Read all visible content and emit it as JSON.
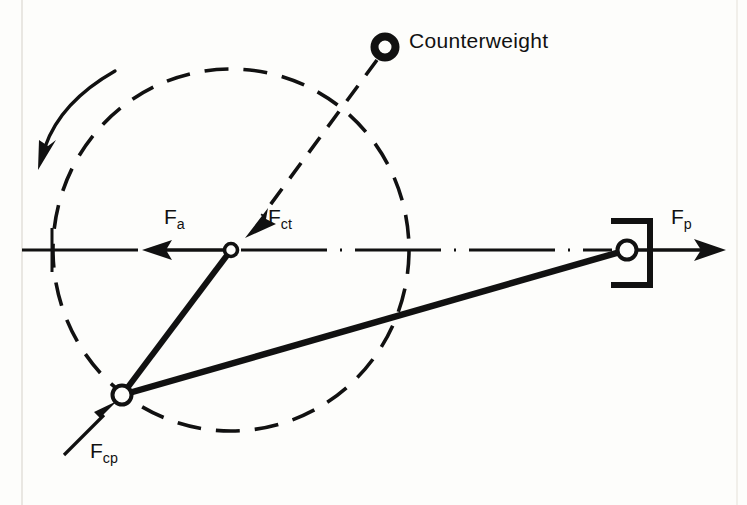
{
  "figure": {
    "title_text": "",
    "background_color": "#fdfdfb",
    "ink_color": "#111111"
  },
  "labels": {
    "counterweight": "Counterweight",
    "force_axial": {
      "symbol": "F",
      "subscript": "a"
    },
    "force_counter_tangential": {
      "symbol": "F",
      "subscript": "ct"
    },
    "force_piston": {
      "symbol": "F",
      "subscript": "p"
    },
    "force_crankpin": {
      "symbol": "F",
      "subscript": "cp"
    }
  },
  "icons": {
    "counterweight": "counterweight-ring-icon",
    "crank_center": "crank-center-pin-icon",
    "crank_pin": "crank-pin-icon",
    "piston_pin": "piston-pin-icon",
    "piston_bracket": "piston-bracket-icon",
    "rotation": "rotation-arrow-icon"
  },
  "geometry": {
    "crank_center": {
      "x": 231,
      "y": 250,
      "r": 6
    },
    "crank_pin": {
      "x": 122,
      "y": 395,
      "r": 9
    },
    "piston_pin": {
      "x": 627,
      "y": 250,
      "r": 9
    },
    "counterweight_ring": {
      "x": 385,
      "y": 47,
      "r_outer": 14,
      "r_inner": 6
    },
    "crank_circle": {
      "cx": 231,
      "cy": 250,
      "r": 180,
      "style": "dashed"
    },
    "centerline": {
      "x1": 22,
      "x2": 725,
      "y": 250,
      "style": "dash-dot"
    },
    "piston_bracket": {
      "x_left": 613,
      "x_right": 652,
      "y_top": 219,
      "y_bottom": 287
    },
    "rotation_direction": "counterclockwise"
  }
}
